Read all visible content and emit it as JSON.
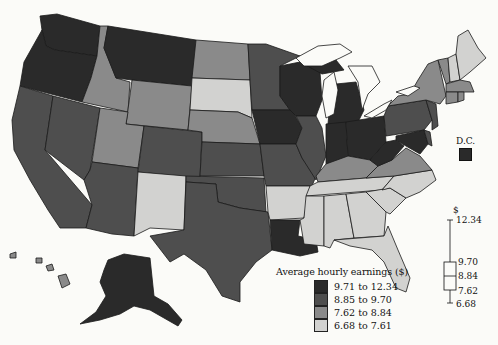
{
  "map": {
    "title": "Average hourly earnings by state",
    "legend": {
      "title": "Average hourly earnings ($)",
      "classes": [
        {
          "label": "9.71 to 12.34",
          "color": "#2a2a2a"
        },
        {
          "label": "8.85 to 9.70",
          "color": "#4e4e4e"
        },
        {
          "label": "7.62 to 8.84",
          "color": "#8a8a8a"
        },
        {
          "label": "6.68 to 7.61",
          "color": "#d2d2d0"
        }
      ]
    },
    "inset_label": "D.C.",
    "boxplot": {
      "unit": "$",
      "max": "12.34",
      "q3": "9.70",
      "median": "8.84",
      "q1": "7.62",
      "min": "6.68"
    },
    "states": {
      "9.71 to 12.34": [
        "WA",
        "OR",
        "MT",
        "AK",
        "WI",
        "MI",
        "IA",
        "IN",
        "OH",
        "WV",
        "LA",
        "DC",
        "MD"
      ],
      "8.85 to 9.70": [
        "CA",
        "NV",
        "AZ",
        "CO",
        "KS",
        "OK",
        "TX",
        "MN",
        "MO",
        "IL",
        "PA",
        "NJ",
        "DE"
      ],
      "7.62 to 8.84": [
        "ID",
        "UT",
        "WY",
        "ND",
        "NE",
        "KY",
        "VA",
        "NY",
        "VT",
        "MA",
        "CT",
        "RI",
        "HI"
      ],
      "6.68 to 7.61": [
        "NM",
        "SD",
        "AR",
        "TN",
        "MS",
        "AL",
        "GA",
        "FL",
        "SC",
        "NC",
        "ME",
        "NH"
      ]
    }
  }
}
